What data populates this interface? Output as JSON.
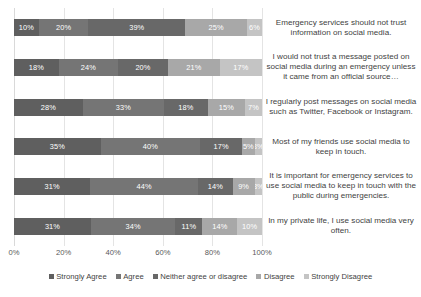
{
  "chart_data": {
    "type": "bar",
    "orientation": "horizontal",
    "stacked": true,
    "stack_mode": "percent",
    "title": "",
    "xlabel": "",
    "ylabel": "",
    "xlim": [
      0,
      100
    ],
    "xticks": [
      "0%",
      "20%",
      "40%",
      "60%",
      "80%",
      "100%"
    ],
    "xtick_values": [
      0,
      20,
      40,
      60,
      80,
      100
    ],
    "grid": true,
    "grid_axis": "x",
    "legend_position": "bottom",
    "categories": [
      "Emergency services should not trust information on social media.",
      "I would not trust a message posted on social media during an emergency unless it came from an official source…",
      "I regularly post messages on social media such as Twitter, Facebook or Instagram.",
      "Most of my friends use social media to keep in touch.",
      "It is important for emergency services to use social media to keep in touch with the public during emergencies.",
      "In my private life, I use social media very often."
    ],
    "series": [
      {
        "name": "Strongly Agree",
        "color": "#5f5f5f",
        "text_color": "#ffffff",
        "values": [
          10,
          18,
          28,
          35,
          31,
          31
        ],
        "labels": [
          "10%",
          "18%",
          "28%",
          "35%",
          "31%",
          "31%"
        ]
      },
      {
        "name": "Agree",
        "color": "#757575",
        "text_color": "#ffffff",
        "values": [
          20,
          24,
          33,
          40,
          44,
          34
        ],
        "labels": [
          "20%",
          "24%",
          "33%",
          "40%",
          "44%",
          "34%"
        ]
      },
      {
        "name": "Neither agree or disagree",
        "color": "#686868",
        "text_color": "#ffffff",
        "values": [
          39,
          20,
          18,
          17,
          14,
          11
        ],
        "labels": [
          "39%",
          "20%",
          "18%",
          "17%",
          "14%",
          "11%"
        ]
      },
      {
        "name": "Disagree",
        "color": "#a8a8a8",
        "text_color": "#ffffff",
        "values": [
          25,
          21,
          15,
          5,
          9,
          14
        ],
        "labels": [
          "25%",
          "21%",
          "15%",
          "5%",
          "9%",
          "14%"
        ]
      },
      {
        "name": "Strongly Disagree",
        "color": "#c4c4c4",
        "text_color": "#ffffff",
        "values": [
          6,
          17,
          7,
          3,
          3,
          10
        ],
        "labels": [
          "6%",
          "17%",
          "7%",
          "3%",
          "3%",
          "10%"
        ]
      }
    ]
  }
}
